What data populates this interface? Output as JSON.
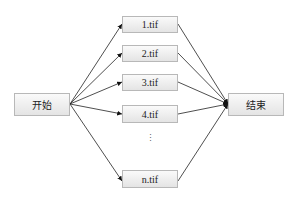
{
  "diagram": {
    "start": {
      "label": "开始"
    },
    "end": {
      "label": "结束"
    },
    "files": [
      {
        "label": "1.tif"
      },
      {
        "label": "2.tif"
      },
      {
        "label": "3.tif"
      },
      {
        "label": "4.tif"
      },
      {
        "label": "n.tif"
      }
    ],
    "ellipsis": "⋮",
    "edges": [
      {
        "from": "开始",
        "to": "1.tif"
      },
      {
        "from": "开始",
        "to": "2.tif"
      },
      {
        "from": "开始",
        "to": "3.tif"
      },
      {
        "from": "开始",
        "to": "4.tif"
      },
      {
        "from": "开始",
        "to": "n.tif"
      },
      {
        "from": "1.tif",
        "to": "结束"
      },
      {
        "from": "2.tif",
        "to": "结束"
      },
      {
        "from": "3.tif",
        "to": "结束"
      },
      {
        "from": "4.tif",
        "to": "结束"
      },
      {
        "from": "n.tif",
        "to": "结束"
      }
    ]
  }
}
